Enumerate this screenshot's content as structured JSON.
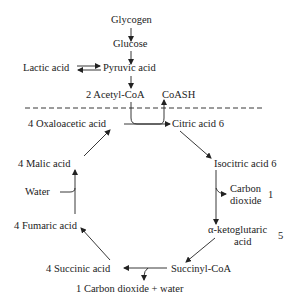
{
  "diagram": {
    "type": "metabolic-pathway",
    "name": "Krebs cycle",
    "nodes": {
      "glycogen": "Glycogen",
      "glucose": "Glucose",
      "lactic_acid": "Lactic acid",
      "pyruvic_acid": "Pyruvic acid",
      "acetyl_coa": "2 Acetyl-CoA",
      "coash": "CoASH",
      "oxaloacetic_acid": "4 Oxaloacetic acid",
      "citric_acid": "Citric acid 6",
      "isocitric_acid": "Isocitric acid 6",
      "carbon_dioxide_1a": "Carbon",
      "carbon_dioxide_1b": "dioxide",
      "carbon_dioxide_1_count": "1",
      "ketoglutaric_a": "α-ketoglutaric",
      "ketoglutaric_b": "acid",
      "ketoglutaric_count": "5",
      "succinyl_coa": "Succinyl-CoA",
      "succinic_acid": "4 Succinic acid",
      "co2_water": "1 Carbon dioxide + water",
      "fumaric_acid": "4 Fumaric acid",
      "water": "Water",
      "malic_acid": "4 Malic acid"
    },
    "edges": [
      [
        "Glycogen",
        "Glucose"
      ],
      [
        "Glucose",
        "Pyruvic acid"
      ],
      [
        "Lactic acid",
        "Pyruvic acid",
        "reversible"
      ],
      [
        "Pyruvic acid",
        "2 Acetyl-CoA"
      ],
      [
        "2 Acetyl-CoA",
        "Citric acid 6"
      ],
      [
        "4 Oxaloacetic acid",
        "Citric acid 6"
      ],
      [
        "Citric acid 6",
        "CoASH"
      ],
      [
        "Citric acid 6",
        "Isocitric acid 6"
      ],
      [
        "Isocitric acid 6",
        "Carbon dioxide"
      ],
      [
        "Isocitric acid 6",
        "α-ketoglutaric acid"
      ],
      [
        "α-ketoglutaric acid",
        "Succinyl-CoA"
      ],
      [
        "Succinyl-CoA",
        "4 Succinic acid"
      ],
      [
        "Succinyl-CoA",
        "1 Carbon dioxide + water"
      ],
      [
        "4 Succinic acid",
        "4 Fumaric acid"
      ],
      [
        "Water",
        "4 Fumaric acid"
      ],
      [
        "4 Fumaric acid",
        "4 Malic acid"
      ],
      [
        "4 Malic acid",
        "4 Oxaloacetic acid"
      ]
    ]
  }
}
